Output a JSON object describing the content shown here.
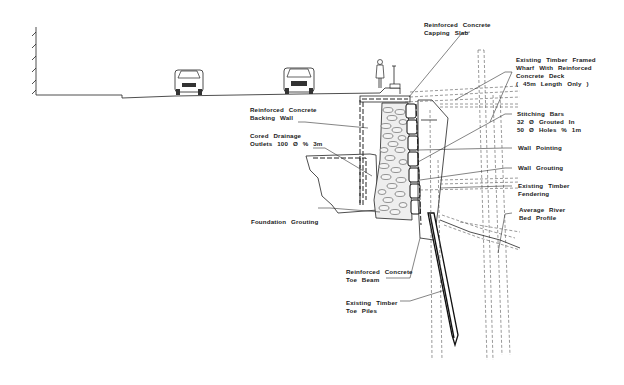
{
  "diagram": {
    "labels": {
      "capping_slab": [
        "Reinforced Concrete",
        "Capping Slab"
      ],
      "timber_wharf": [
        "Existing Timber Framed",
        "Wharf With Reinforced",
        "Concrete Deck",
        "( 45m Length Only )"
      ],
      "backing_wall": [
        "Reinforced Concrete",
        "Backing Wall"
      ],
      "drainage": [
        "Cored Drainage",
        "Outlets 100 Ø % 3m"
      ],
      "stitching_bars": [
        "Stitching Bars",
        "32 Ø Grouted In",
        "50 Ø Holes % 1m"
      ],
      "wall_pointing": [
        "Wall Pointing"
      ],
      "wall_grouting": [
        "Wall Grouting"
      ],
      "timber_fendering": [
        "Existing Timber",
        "Fendering"
      ],
      "river_bed": [
        "Average River",
        "Bed Profile"
      ],
      "foundation_grouting": [
        "Foundation Grouting"
      ],
      "toe_beam": [
        "Reinforced Concrete",
        "Toe Beam"
      ],
      "toe_piles": [
        "Existing Timber",
        "Toe Piles"
      ]
    },
    "elements": [
      "building-wall",
      "road-surface",
      "car-left",
      "car-right",
      "pedestrian",
      "bollard",
      "stone-masonry-wall",
      "timber-piles",
      "river-bed"
    ]
  }
}
